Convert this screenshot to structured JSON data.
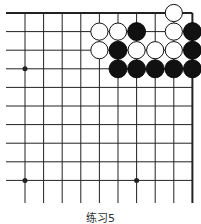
{
  "board": {
    "columns_shown": 10,
    "rows_shown": 11,
    "edges": [
      "top",
      "right"
    ],
    "star_points": [
      [
        0,
        3
      ],
      [
        0,
        9
      ],
      [
        6,
        9
      ]
    ],
    "stones": [
      {
        "color": "white",
        "col": 8,
        "row": 0
      },
      {
        "color": "white",
        "col": 4,
        "row": 1
      },
      {
        "color": "white",
        "col": 5,
        "row": 1
      },
      {
        "color": "black",
        "col": 6,
        "row": 1
      },
      {
        "color": "white",
        "col": 8,
        "row": 1
      },
      {
        "color": "black",
        "col": 9,
        "row": 1
      },
      {
        "color": "white",
        "col": 4,
        "row": 2
      },
      {
        "color": "black",
        "col": 5,
        "row": 2
      },
      {
        "color": "white",
        "col": 6,
        "row": 2
      },
      {
        "color": "white",
        "col": 7,
        "row": 2
      },
      {
        "color": "white",
        "col": 8,
        "row": 2
      },
      {
        "color": "black",
        "col": 9,
        "row": 2
      },
      {
        "color": "black",
        "col": 5,
        "row": 3
      },
      {
        "color": "black",
        "col": 6,
        "row": 3
      },
      {
        "color": "black",
        "col": 7,
        "row": 3
      },
      {
        "color": "black",
        "col": 8,
        "row": 3
      },
      {
        "color": "black",
        "col": 9,
        "row": 3
      }
    ],
    "colors": {
      "line": "#222222",
      "black_stone": "#111111",
      "white_stone": "#ffffff"
    }
  },
  "caption": "练习5"
}
